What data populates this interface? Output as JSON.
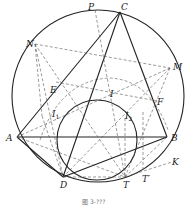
{
  "figure": {
    "caption": "图 3-???",
    "points": {
      "A": "A",
      "B": "B",
      "C": "C",
      "P": "P",
      "N": "N",
      "M": "M",
      "E": "E",
      "F": "F",
      "I": "I",
      "I1": "I",
      "I1_sub": "1",
      "I2": "I",
      "I2_sub": "2",
      "D": "D",
      "T": "T",
      "T_prime": "T′",
      "K": "K"
    },
    "circles": [
      "circumcircle of ABC",
      "circle through D and T tangent internally"
    ],
    "colors": {
      "line": "#222222",
      "dashed": "#555555",
      "background": "#ffffff"
    }
  }
}
